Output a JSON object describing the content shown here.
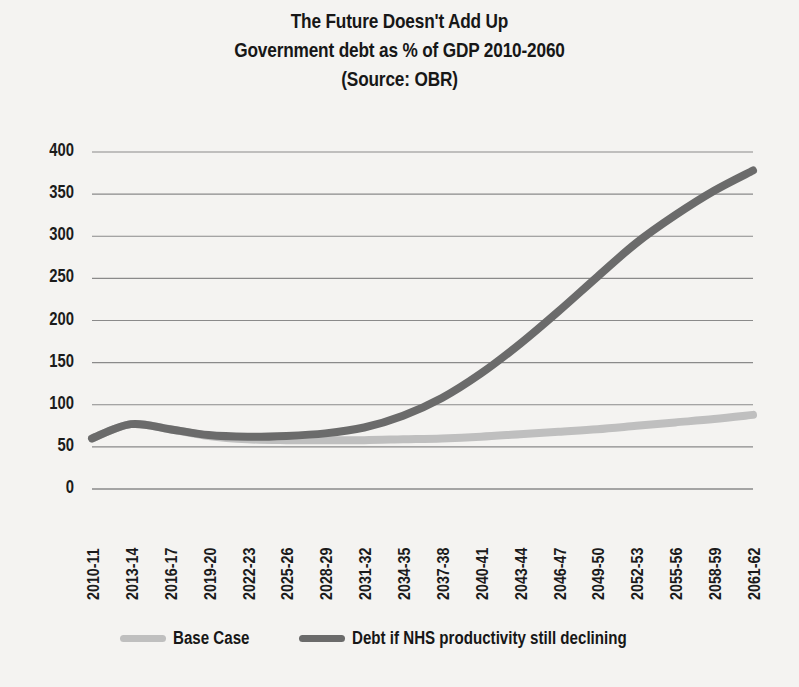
{
  "chart_data": {
    "type": "line",
    "title": "The Future Doesn't Add Up",
    "subtitle": "Government debt as % of GDP 2010-2060",
    "source_line": "(Source: OBR)",
    "xlabel": "",
    "ylabel": "",
    "ylim": [
      0,
      400
    ],
    "ytick_step": 50,
    "grid": true,
    "legend_position": "bottom",
    "categories": [
      "2010-11",
      "2013-14",
      "2016-17",
      "2019-20",
      "2022-23",
      "2025-26",
      "2028-29",
      "2031-32",
      "2034-35",
      "2037-38",
      "2040-41",
      "2043-44",
      "2046-47",
      "2049-50",
      "2052-53",
      "2055-56",
      "2058-59",
      "2061-62"
    ],
    "yticks": [
      "0",
      "50",
      "100",
      "150",
      "200",
      "250",
      "300",
      "350",
      "400"
    ],
    "series": [
      {
        "name": "Base Case",
        "color": "#bfbfbf",
        "values": [
          60,
          77,
          71,
          63,
          59,
          58,
          58,
          58,
          59,
          60,
          62,
          65,
          68,
          71,
          75,
          79,
          83,
          88
        ]
      },
      {
        "name": "Debt if NHS productivity still declining",
        "color": "#6b6b6b",
        "values": [
          60,
          77,
          71,
          64,
          62,
          63,
          66,
          73,
          87,
          108,
          137,
          172,
          211,
          252,
          292,
          325,
          354,
          378
        ]
      }
    ]
  },
  "colors": {
    "background": "#f4f3f1",
    "text": "#171717",
    "grid": "#8a8a8a",
    "base_case": "#bfbfbf",
    "nhs_decline": "#6b6b6b"
  }
}
